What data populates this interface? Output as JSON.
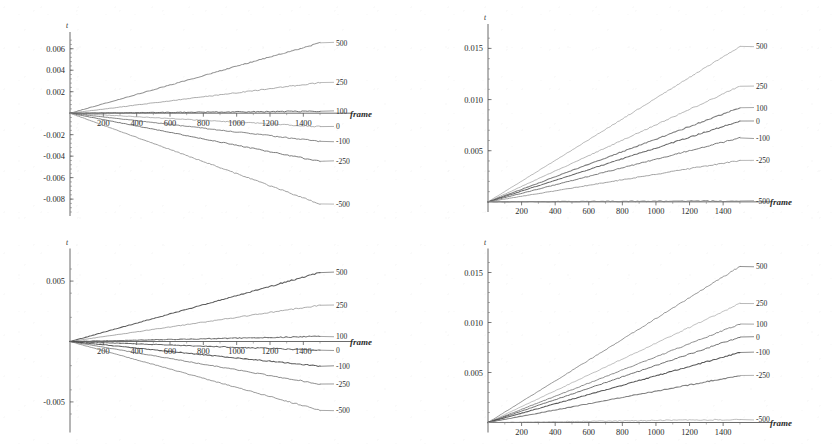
{
  "figure": {
    "background_color": "#ffffff",
    "ink_color": "#2b2b2b",
    "panel_count": 4
  },
  "chart_data": [
    {
      "id": "top-left",
      "type": "line",
      "title": "",
      "xlabel": "frame",
      "ylabel": "t",
      "xlim": [
        0,
        1560
      ],
      "ylim": [
        -0.0092,
        0.007
      ],
      "xticks": [
        200,
        400,
        600,
        800,
        1000,
        1200,
        1400
      ],
      "yticks": [
        0.006,
        0.004,
        0.002,
        -0.002,
        -0.004,
        -0.006,
        -0.008
      ],
      "ytick_labels": [
        "0.006",
        "0.004",
        "0.002",
        "-0.002",
        "-0.004",
        "-0.006",
        "-0.008"
      ],
      "xtick_labels": [
        "200",
        "400",
        "600",
        "800",
        "1000",
        "1200",
        "1400"
      ],
      "grid": false,
      "legend_position": "right-inline",
      "x_end": 1500,
      "series": [
        {
          "name": "500",
          "label": "500",
          "y_end": 0.00655,
          "shade": "#8a8a8a"
        },
        {
          "name": "250",
          "label": "250",
          "y_end": 0.00285,
          "shade": "#8f8f8f"
        },
        {
          "name": "100",
          "label": "100",
          "y_end": 0.00018,
          "shade": "#565656"
        },
        {
          "name": "0",
          "label": "0",
          "y_end": -0.00125,
          "shade": "#7a7a7a"
        },
        {
          "name": "-100",
          "label": "-100",
          "y_end": -0.00262,
          "shade": "#5e5e5e"
        },
        {
          "name": "-250",
          "label": "-250",
          "y_end": -0.00448,
          "shade": "#6a6a6a"
        },
        {
          "name": "-500",
          "label": "-500",
          "y_end": -0.00845,
          "shade": "#8a8a8a"
        }
      ]
    },
    {
      "id": "top-right",
      "type": "line",
      "title": "",
      "xlabel": "frame",
      "ylabel": "t",
      "xlim": [
        0,
        1560
      ],
      "ylim": [
        -0.0006,
        0.0168
      ],
      "xticks": [
        200,
        400,
        600,
        800,
        1000,
        1200,
        1400
      ],
      "yticks": [
        0.015,
        0.01,
        0.005
      ],
      "ytick_labels": [
        "0.015",
        "0.010",
        "0.005"
      ],
      "xtick_labels": [
        "200",
        "400",
        "600",
        "800",
        "1000",
        "1200",
        "1400"
      ],
      "grid": false,
      "legend_position": "right-inline",
      "x_end": 1500,
      "series": [
        {
          "name": "500",
          "label": "500",
          "y_end": 0.0152,
          "shade": "#8e8e8e"
        },
        {
          "name": "250",
          "label": "250",
          "y_end": 0.0113,
          "shade": "#8a8a8a"
        },
        {
          "name": "100",
          "label": "100",
          "y_end": 0.0092,
          "shade": "#6e6e6e"
        },
        {
          "name": "0",
          "label": "0",
          "y_end": 0.0079,
          "shade": "#4e4e4e"
        },
        {
          "name": "-100",
          "label": "-100",
          "y_end": 0.00625,
          "shade": "#5c5c5c"
        },
        {
          "name": "-250",
          "label": "-250",
          "y_end": 0.00405,
          "shade": "#8a8a8a"
        },
        {
          "name": "-500",
          "label": "-500",
          "y_end": 0.0001,
          "shade": "#7d7d7d"
        }
      ]
    },
    {
      "id": "bottom-left",
      "type": "line",
      "title": "",
      "xlabel": "frame",
      "ylabel": "t",
      "xlim": [
        0,
        1560
      ],
      "ylim": [
        -0.0072,
        0.0072
      ],
      "xticks": [
        200,
        400,
        600,
        800,
        1000,
        1200,
        1400
      ],
      "yticks": [
        0.005,
        -0.005
      ],
      "ytick_labels": [
        "0.005",
        "-0.005"
      ],
      "xtick_labels": [
        "200",
        "400",
        "600",
        "800",
        "1000",
        "1200",
        "1400"
      ],
      "grid": false,
      "legend_position": "right-inline",
      "x_end": 1500,
      "series": [
        {
          "name": "500",
          "label": "500",
          "y_end": 0.0057,
          "shade": "#3f3f3f"
        },
        {
          "name": "250",
          "label": "250",
          "y_end": 0.003,
          "shade": "#7c7c7c"
        },
        {
          "name": "100",
          "label": "100",
          "y_end": 0.00042,
          "shade": "#6a6a6a"
        },
        {
          "name": "0",
          "label": "0",
          "y_end": -0.00072,
          "shade": "#565656"
        },
        {
          "name": "-100",
          "label": "-100",
          "y_end": -0.00205,
          "shade": "#3c3c3c"
        },
        {
          "name": "-250",
          "label": "-250",
          "y_end": -0.00352,
          "shade": "#5a5a5a"
        },
        {
          "name": "-500",
          "label": "-500",
          "y_end": -0.0057,
          "shade": "#6f6f6f"
        }
      ]
    },
    {
      "id": "bottom-right",
      "type": "line",
      "title": "",
      "xlabel": "frame",
      "ylabel": "t",
      "xlim": [
        0,
        1560
      ],
      "ylim": [
        -0.0006,
        0.0168
      ],
      "xticks": [
        200,
        400,
        600,
        800,
        1000,
        1200,
        1400
      ],
      "yticks": [
        0.015,
        0.01,
        0.005
      ],
      "ytick_labels": [
        "0.015",
        "0.010",
        "0.005"
      ],
      "xtick_labels": [
        "200",
        "400",
        "600",
        "800",
        "1000",
        "1200",
        "1400"
      ],
      "grid": false,
      "legend_position": "right-inline",
      "x_end": 1500,
      "series": [
        {
          "name": "500",
          "label": "500",
          "y_end": 0.0156,
          "shade": "#4a4a4a"
        },
        {
          "name": "250",
          "label": "250",
          "y_end": 0.0119,
          "shade": "#8a8a8a"
        },
        {
          "name": "100",
          "label": "100",
          "y_end": 0.00985,
          "shade": "#6a6a6a"
        },
        {
          "name": "0",
          "label": "0",
          "y_end": 0.00855,
          "shade": "#3a3a3a"
        },
        {
          "name": "-100",
          "label": "-100",
          "y_end": 0.007,
          "shade": "#3f3f3f"
        },
        {
          "name": "-250",
          "label": "-250",
          "y_end": 0.0047,
          "shade": "#7e7e7e"
        },
        {
          "name": "-500",
          "label": "-500",
          "y_end": 0.0003,
          "shade": "#909090"
        }
      ]
    }
  ]
}
